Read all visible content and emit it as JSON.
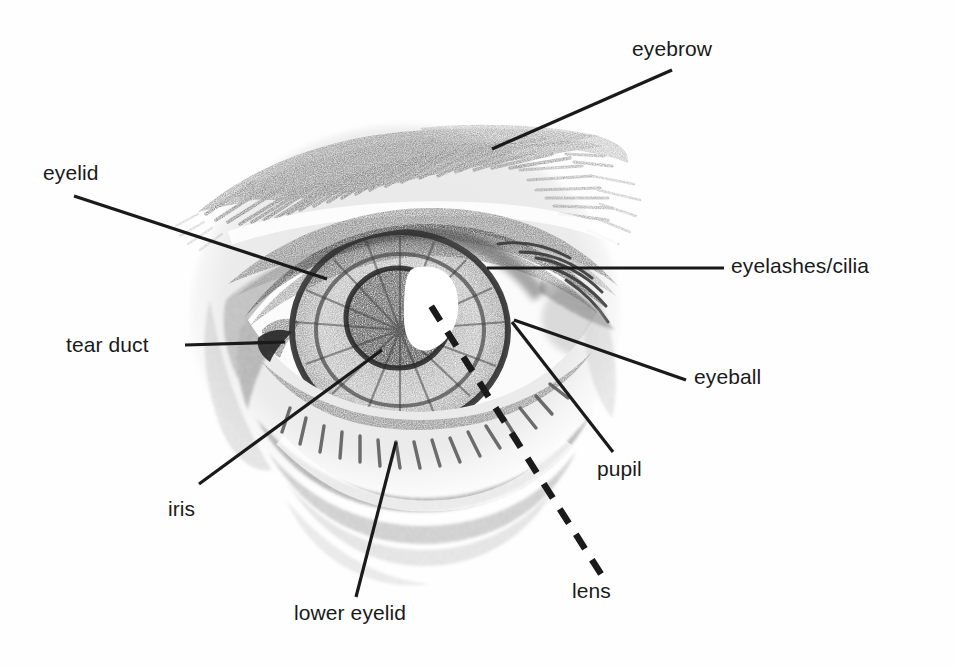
{
  "figure": {
    "style": "pencil sketch illustration with leader-line labels",
    "background_color": "#ffffff",
    "line_color": "#1a1a1a",
    "text_color": "#1a1a1a"
  },
  "labels": [
    {
      "id": "eyebrow",
      "text": "eyebrow",
      "x": 632,
      "y": 38,
      "leader": {
        "type": "solid",
        "x1": 672,
        "y1": 70,
        "x2": 492,
        "y2": 149
      }
    },
    {
      "id": "eyelid",
      "text": "eyelid",
      "x": 43,
      "y": 162,
      "leader": {
        "type": "solid",
        "x1": 74,
        "y1": 196,
        "x2": 327,
        "y2": 279
      }
    },
    {
      "id": "eyelashes-cilia",
      "text": "eyelashes/cilia",
      "x": 731,
      "y": 255,
      "leader": {
        "type": "solid",
        "x1": 724,
        "y1": 268,
        "x2": 487,
        "y2": 268
      }
    },
    {
      "id": "tear-duct",
      "text": "tear duct",
      "x": 66,
      "y": 334,
      "leader": {
        "type": "solid",
        "x1": 185,
        "y1": 345,
        "x2": 285,
        "y2": 342
      }
    },
    {
      "id": "eyeball",
      "text": "eyeball",
      "x": 694,
      "y": 366,
      "leader": {
        "type": "solid",
        "x1": 686,
        "y1": 380,
        "x2": 514,
        "y2": 320
      }
    },
    {
      "id": "pupil",
      "text": "pupil",
      "x": 597,
      "y": 458,
      "leader": {
        "type": "solid",
        "x1": 613,
        "y1": 452,
        "x2": 512,
        "y2": 322
      }
    },
    {
      "id": "iris",
      "text": "iris",
      "x": 168,
      "y": 498,
      "leader": {
        "type": "solid",
        "x1": 199,
        "y1": 484,
        "x2": 382,
        "y2": 350
      }
    },
    {
      "id": "lower-eyelid",
      "text": "lower eyelid",
      "x": 294,
      "y": 602,
      "leader": {
        "type": "solid",
        "x1": 356,
        "y1": 597,
        "x2": 396,
        "y2": 442
      }
    },
    {
      "id": "lens",
      "text": "lens",
      "x": 572,
      "y": 580,
      "leader": {
        "type": "dashed",
        "x1": 601,
        "y1": 574,
        "x2": 431,
        "y2": 306
      }
    }
  ]
}
